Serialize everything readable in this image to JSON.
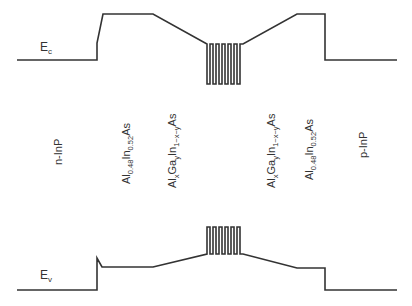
{
  "bands": {
    "conduction": {
      "symbol": "E",
      "subscript": "c"
    },
    "valence": {
      "symbol": "E",
      "subscript": "v"
    }
  },
  "layers": [
    {
      "id": "n-inp",
      "label": "n-InP"
    },
    {
      "id": "alinas-left",
      "base": "Al",
      "s1": "0.48",
      "mid": "In",
      "s2": "0.52",
      "end": "As"
    },
    {
      "id": "algainas-left",
      "base": "Al",
      "s1": "x",
      "mid": "Ga",
      "s2": "y",
      "mid2": "In",
      "s3": "1−x−y",
      "end": "As"
    },
    {
      "id": "algainas-right",
      "base": "Al",
      "s1": "x",
      "mid": "Ga",
      "s2": "y",
      "mid2": "In",
      "s3": "1−x−y",
      "end": "As"
    },
    {
      "id": "alinas-right",
      "base": "Al",
      "s1": "0.48",
      "mid": "In",
      "s2": "0.52",
      "end": "As"
    },
    {
      "id": "p-inp",
      "label": "p-InP"
    }
  ],
  "quantum_wells": {
    "count": 5
  },
  "colors": {
    "line": "#333333",
    "background": "#ffffff"
  }
}
